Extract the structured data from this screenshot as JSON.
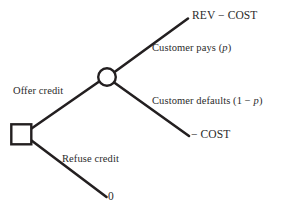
{
  "figure": {
    "type": "decision-tree",
    "background_color": "#ffffff",
    "line_color": "#231f20",
    "text_color": "#2b2b2b"
  },
  "nodes": {
    "decision": {
      "name": "decision-node",
      "shape": "square",
      "x": 11,
      "y": 124,
      "size": 20
    },
    "chance": {
      "name": "chance-node",
      "shape": "circle",
      "cx": 107,
      "cy": 77,
      "r": 9
    }
  },
  "branches": [
    {
      "id": "offer-credit",
      "label": "Offer credit",
      "from": "decision",
      "to": "chance"
    },
    {
      "id": "refuse-credit",
      "label": "Refuse credit",
      "from": "decision",
      "to": "terminal-zero"
    },
    {
      "id": "customer-pays",
      "label": "Customer pays (p)",
      "probability": "p",
      "from": "chance",
      "to": "terminal-rev-cost"
    },
    {
      "id": "customer-defaults",
      "label": "Customer defaults (1 − p)",
      "probability": "1 − p",
      "from": "chance",
      "to": "terminal-cost"
    }
  ],
  "payoffs": [
    {
      "id": "terminal-rev-cost",
      "label": "REV − COST"
    },
    {
      "id": "terminal-cost",
      "label": "− COST"
    },
    {
      "id": "terminal-zero",
      "label": "0"
    }
  ],
  "labels": {
    "offer_credit": "Offer credit",
    "refuse_credit": "Refuse credit",
    "customer_pays_prefix": "Customer pays (",
    "customer_pays_var": "p",
    "customer_pays_suffix": ")",
    "customer_defaults_prefix": "Customer defaults (1 − ",
    "customer_defaults_var": "p",
    "customer_defaults_suffix": ")",
    "payoff_rev_cost": "REV − COST",
    "payoff_neg_cost": "− COST",
    "payoff_zero": "0"
  }
}
